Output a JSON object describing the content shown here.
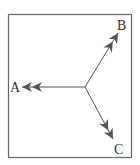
{
  "diagram": {
    "type": "vector-diagram",
    "labels": {
      "a": "A",
      "b": "B",
      "c": "C"
    },
    "colors": {
      "stroke": "#555555",
      "frame": "#666666",
      "text": "#333333"
    }
  }
}
